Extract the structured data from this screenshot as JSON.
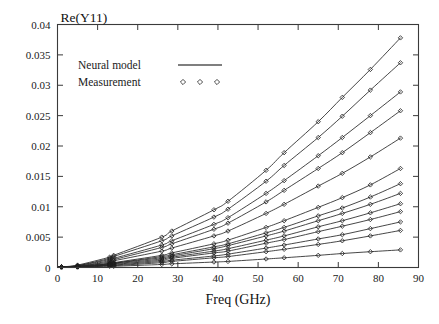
{
  "figure": {
    "width": 439,
    "height": 324,
    "background": "#ffffff",
    "line_color": "#262626",
    "marker_color": "#1d1d1d",
    "frame_color": "#3a3a3a"
  },
  "chart_data": {
    "type": "line",
    "title": "Re(Y11)",
    "xlabel": "Freq (GHz)",
    "ylabel": "",
    "xlim": [
      0,
      90
    ],
    "ylim": [
      0,
      0.04
    ],
    "xticks": [
      0,
      10,
      20,
      30,
      40,
      50,
      60,
      70,
      80,
      90
    ],
    "xtick_labels": [
      "0",
      "10",
      "20",
      "30",
      "40",
      "50",
      "60",
      "70",
      "80",
      "90"
    ],
    "yticks": [
      0,
      0.005,
      0.01,
      0.015,
      0.02,
      0.025,
      0.03,
      0.035,
      0.04
    ],
    "ytick_labels": [
      "0",
      "0.005",
      "0.01",
      "0.015",
      "0.02",
      "0.025",
      "0.03",
      "0.035",
      "0.04"
    ],
    "grid": false,
    "legend_position": "upper-left-inside",
    "legend": [
      {
        "label": "Neural model",
        "style": "line"
      },
      {
        "label": "Measurement",
        "style": "diamond"
      }
    ],
    "marker_x": [
      1,
      5,
      13,
      14,
      26,
      28.5,
      39,
      42.5,
      52,
      56.5,
      65,
      71,
      78,
      85.5
    ],
    "series": [
      {
        "name": "bias-1",
        "x": [
          1,
          5,
          13,
          14,
          26,
          28.5,
          39,
          42.5,
          52,
          56.5,
          65,
          71,
          78,
          85.5
        ],
        "values": [
          0.0001,
          0.0004,
          0.0017,
          0.002,
          0.005,
          0.006,
          0.0095,
          0.0109,
          0.016,
          0.0189,
          0.024,
          0.028,
          0.0326,
          0.0378
        ]
      },
      {
        "name": "bias-2",
        "x": [
          1,
          5,
          13,
          14,
          26,
          28.5,
          39,
          42.5,
          52,
          56.5,
          65,
          71,
          78,
          85.5
        ],
        "values": [
          0.0001,
          0.0003,
          0.0015,
          0.0018,
          0.0044,
          0.0052,
          0.0083,
          0.0096,
          0.0142,
          0.0168,
          0.0214,
          0.0249,
          0.0292,
          0.0337
        ]
      },
      {
        "name": "bias-3",
        "x": [
          1,
          5,
          13,
          14,
          26,
          28.5,
          39,
          42.5,
          52,
          56.5,
          65,
          71,
          78,
          85.5
        ],
        "values": [
          0.0001,
          0.0003,
          0.0013,
          0.0015,
          0.0037,
          0.0044,
          0.0071,
          0.0082,
          0.0122,
          0.0143,
          0.0184,
          0.0214,
          0.025,
          0.0289
        ]
      },
      {
        "name": "bias-4",
        "x": [
          1,
          5,
          13,
          14,
          26,
          28.5,
          39,
          42.5,
          52,
          56.5,
          65,
          71,
          78,
          85.5
        ],
        "values": [
          0.0001,
          0.0002,
          0.0011,
          0.0013,
          0.0033,
          0.0039,
          0.0063,
          0.0073,
          0.0108,
          0.0127,
          0.0163,
          0.0189,
          0.0222,
          0.0258
        ]
      },
      {
        "name": "bias-5",
        "x": [
          1,
          5,
          13,
          14,
          26,
          28.5,
          39,
          42.5,
          52,
          56.5,
          65,
          71,
          78,
          85.5
        ],
        "values": [
          0.0001,
          0.0002,
          0.0009,
          0.0011,
          0.0027,
          0.0032,
          0.0052,
          0.006,
          0.0089,
          0.0104,
          0.0134,
          0.0155,
          0.0182,
          0.0213
        ]
      },
      {
        "name": "bias-6",
        "x": [
          1,
          5,
          13,
          14,
          26,
          28.5,
          39,
          42.5,
          52,
          56.5,
          65,
          71,
          78,
          85.5
        ],
        "values": [
          0.0001,
          0.0002,
          0.0007,
          0.0008,
          0.002,
          0.0024,
          0.0039,
          0.0045,
          0.0066,
          0.0077,
          0.0099,
          0.0115,
          0.0136,
          0.0163
        ]
      },
      {
        "name": "bias-7",
        "x": [
          1,
          5,
          13,
          14,
          26,
          28.5,
          39,
          42.5,
          52,
          56.5,
          65,
          71,
          78,
          85.5
        ],
        "values": [
          0.0001,
          0.0002,
          0.0006,
          0.0007,
          0.0018,
          0.0021,
          0.0034,
          0.0039,
          0.0057,
          0.0066,
          0.0085,
          0.0098,
          0.0116,
          0.0138
        ]
      },
      {
        "name": "bias-8",
        "x": [
          1,
          5,
          13,
          14,
          26,
          28.5,
          39,
          42.5,
          52,
          56.5,
          65,
          71,
          78,
          85.5
        ],
        "values": [
          0.0001,
          0.0001,
          0.0006,
          0.0007,
          0.0016,
          0.0019,
          0.0031,
          0.0036,
          0.0052,
          0.006,
          0.0077,
          0.0089,
          0.0104,
          0.0122
        ]
      },
      {
        "name": "bias-9",
        "x": [
          1,
          5,
          13,
          14,
          26,
          28.5,
          39,
          42.5,
          52,
          56.5,
          65,
          71,
          78,
          85.5
        ],
        "values": [
          0.0001,
          0.0001,
          0.0005,
          0.0006,
          0.0014,
          0.0017,
          0.0027,
          0.0031,
          0.0045,
          0.0052,
          0.0067,
          0.0077,
          0.009,
          0.0105
        ]
      },
      {
        "name": "bias-10",
        "x": [
          1,
          5,
          13,
          14,
          26,
          28.5,
          39,
          42.5,
          52,
          56.5,
          65,
          71,
          78,
          85.5
        ],
        "values": [
          0.0001,
          0.0001,
          0.0004,
          0.0005,
          0.0012,
          0.0015,
          0.0024,
          0.0027,
          0.004,
          0.0046,
          0.0059,
          0.0068,
          0.0079,
          0.0092
        ]
      },
      {
        "name": "bias-11",
        "x": [
          1,
          5,
          13,
          14,
          26,
          28.5,
          39,
          42.5,
          52,
          56.5,
          65,
          71,
          78,
          85.5
        ],
        "values": [
          0.0001,
          0.0001,
          0.0004,
          0.0004,
          0.001,
          0.0012,
          0.0019,
          0.0022,
          0.0032,
          0.0037,
          0.0047,
          0.0054,
          0.0064,
          0.0075
        ]
      },
      {
        "name": "bias-12",
        "x": [
          1,
          5,
          13,
          14,
          26,
          28.5,
          39,
          42.5,
          52,
          56.5,
          65,
          71,
          78,
          85.5
        ],
        "values": [
          0.0001,
          0.0001,
          0.0003,
          0.0003,
          0.0008,
          0.001,
          0.0016,
          0.0018,
          0.0026,
          0.003,
          0.0038,
          0.0044,
          0.0052,
          0.0061
        ]
      },
      {
        "name": "bias-13",
        "x": [
          1,
          5,
          13,
          14,
          26,
          28.5,
          39,
          42.5,
          52,
          56.5,
          65,
          71,
          78,
          85.5
        ],
        "values": [
          0.0001,
          0.0001,
          0.0002,
          0.0002,
          0.0005,
          0.0006,
          0.0009,
          0.001,
          0.0014,
          0.0016,
          0.002,
          0.0023,
          0.0026,
          0.0029
        ]
      }
    ]
  }
}
